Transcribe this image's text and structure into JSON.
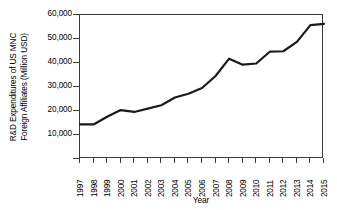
{
  "chart_data": {
    "type": "line",
    "title": "",
    "xlabel": "Year",
    "ylabel_lines": [
      "R&D Expenditures of US MNC",
      "Foreign Affiliates (Million USD)"
    ],
    "ylabel": "R&D Expenditures of US MNC Foreign Affiliates (Million USD)",
    "categories": [
      "1997",
      "1998",
      "1999",
      "2000",
      "2001",
      "2002",
      "2003",
      "2004",
      "2005",
      "2006",
      "2007",
      "2008",
      "2009",
      "2010",
      "2011",
      "2012",
      "2013",
      "2014",
      "2015"
    ],
    "values": [
      14400,
      14400,
      17600,
      20400,
      19600,
      21000,
      22400,
      25600,
      27200,
      29600,
      34600,
      41800,
      39300,
      39800,
      44700,
      44900,
      48800,
      55800,
      56300
    ],
    "series": [
      {
        "name": "R&D Expenditures",
        "values": [
          14400,
          14400,
          17600,
          20400,
          19600,
          21000,
          22400,
          25600,
          27200,
          29600,
          34600,
          41800,
          39300,
          39800,
          44700,
          44900,
          48800,
          55800,
          56300
        ]
      }
    ],
    "ylim": [
      0,
      60000
    ],
    "ytick_values": [
      10000,
      20000,
      30000,
      40000,
      50000,
      60000
    ],
    "ytick_labels": [
      "10,000",
      "20,000",
      "30,000",
      "40,000",
      "50,000",
      "60,000"
    ],
    "xlim": [
      "1997",
      "2015"
    ],
    "grid": false,
    "legend": false,
    "line_color": "#1a1a1a",
    "line_width": 2.2,
    "axis_color": "#3a3a3a",
    "background_color": "#ffffff"
  }
}
